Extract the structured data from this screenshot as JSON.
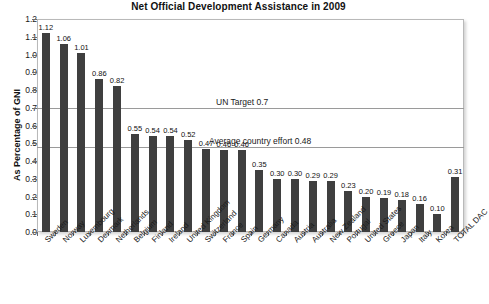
{
  "chart_data": {
    "type": "bar",
    "title": "Net Official Development Assistance in 2009",
    "xlabel": "",
    "ylabel": "As Percentage of GNI",
    "ylim": [
      0.0,
      1.2
    ],
    "ytick_step": 0.1,
    "grid": false,
    "legend": "none",
    "bar_color": "#3f3f3f",
    "categories": [
      "Sweden",
      "Norway",
      "Luxembourg",
      "Denmark",
      "Netherlands",
      "Belgium",
      "Finland",
      "Ireland",
      "United Kingdom",
      "Switzerland",
      "France",
      "Spain",
      "Germany",
      "Canada",
      "Austria",
      "Australia",
      "New Zealand",
      "Portugal",
      "United States",
      "Greece",
      "Japan",
      "Italy",
      "Korea",
      "TOTAL DAC"
    ],
    "values": [
      1.12,
      1.06,
      1.01,
      0.86,
      0.82,
      0.55,
      0.54,
      0.54,
      0.52,
      0.47,
      0.46,
      0.46,
      0.35,
      0.3,
      0.3,
      0.29,
      0.29,
      0.23,
      0.2,
      0.19,
      0.18,
      0.16,
      0.1,
      0.31
    ],
    "value_labels": [
      "1.12",
      "1.06",
      "1.01",
      "0.86",
      "0.82",
      "0.55",
      "0.54",
      "0.54",
      "0.52",
      "0.47",
      "0.46",
      "0.46",
      "0.35",
      "0.30",
      "0.30",
      "0.29",
      "0.29",
      "0.23",
      "0.20",
      "0.19",
      "0.18",
      "0.16",
      "0.10",
      "0.31"
    ],
    "ytick_labels": [
      "0.0",
      "0.1",
      "0.2",
      "0.3",
      "0.4",
      "0.5",
      "0.6",
      "0.7",
      "0.8",
      "0.9",
      "1.0",
      "1.1",
      "1.2"
    ],
    "reference_lines": [
      {
        "value": 0.7,
        "label": "UN Target 0.7"
      },
      {
        "value": 0.48,
        "label": "Average country effort 0.48"
      }
    ]
  }
}
